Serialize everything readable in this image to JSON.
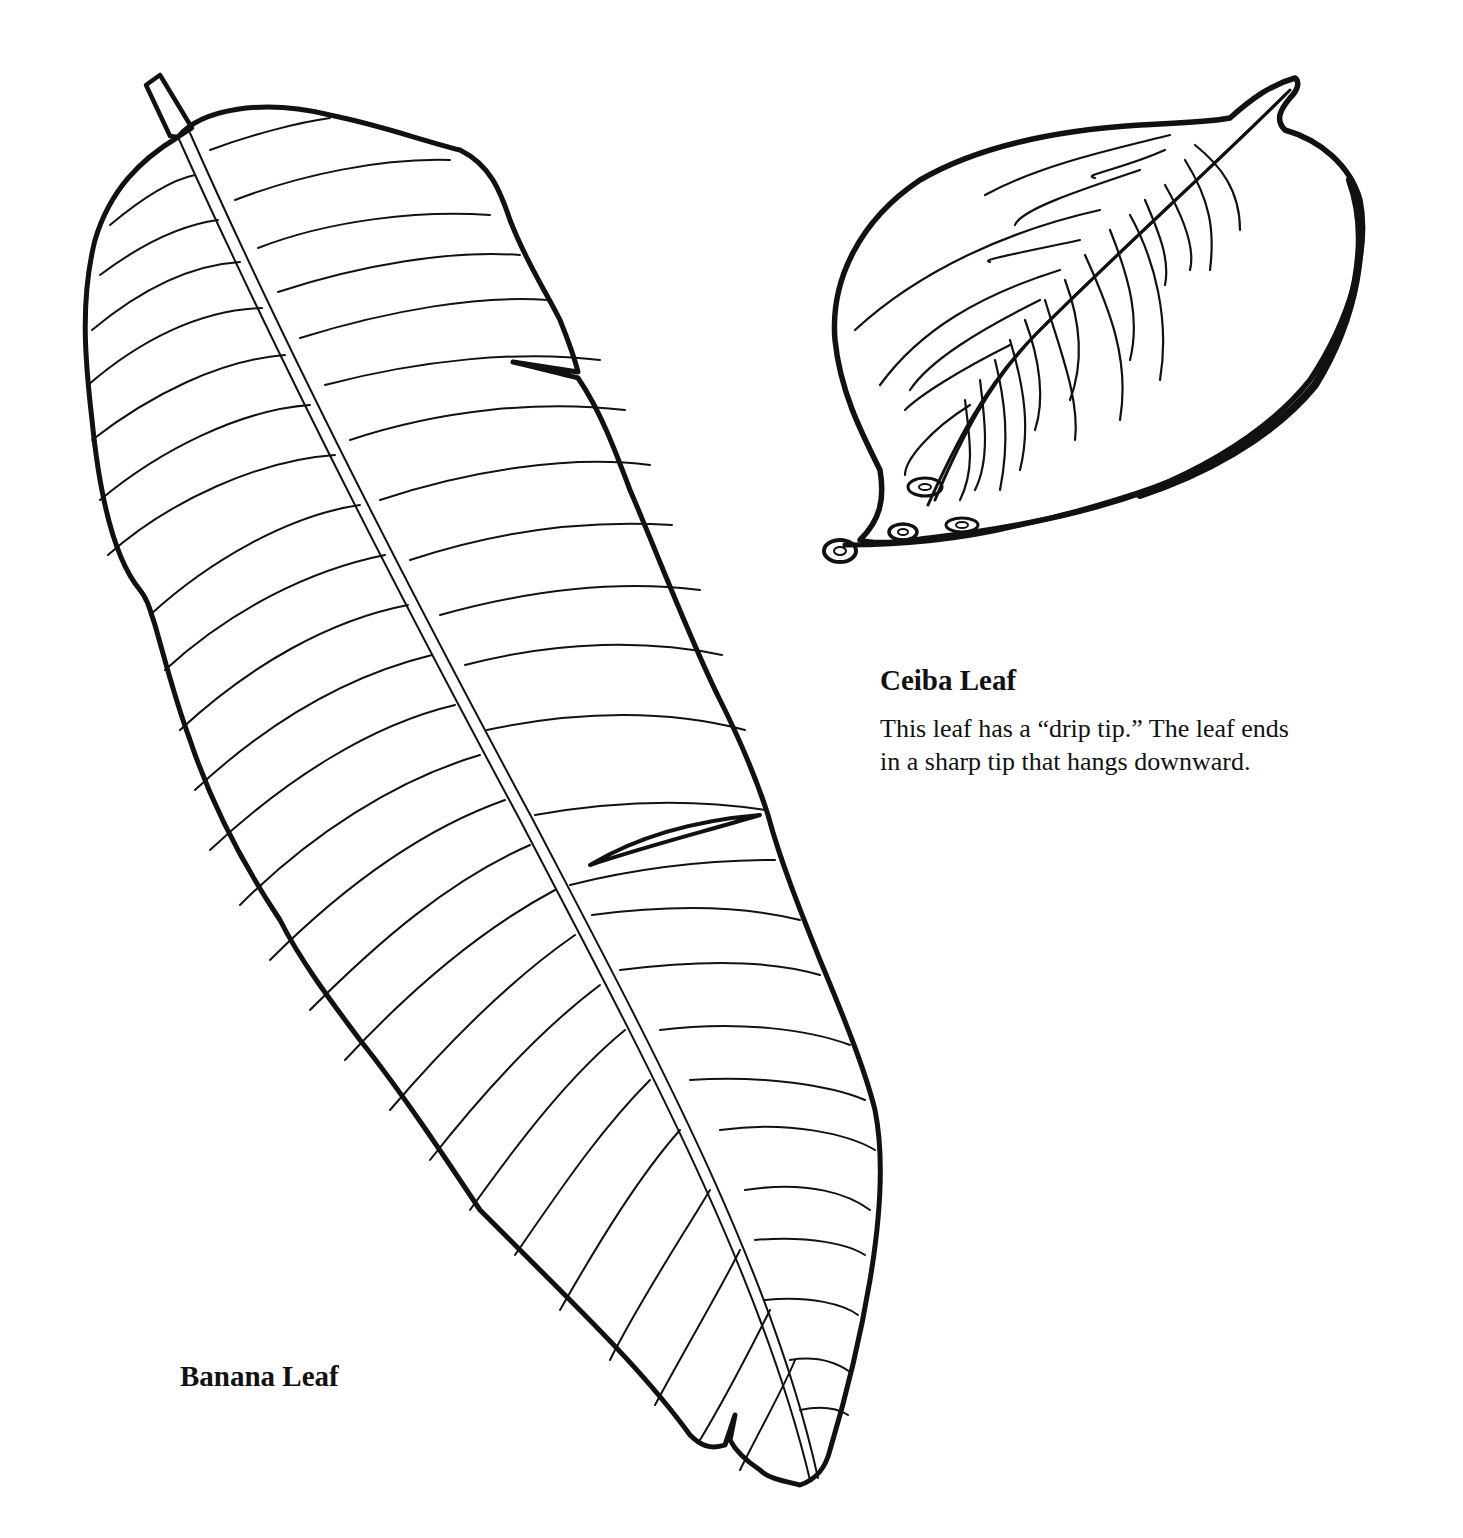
{
  "worksheet": {
    "banana_leaf": {
      "title": "Banana Leaf",
      "illustration": "banana-leaf-line-drawing"
    },
    "ceiba_leaf": {
      "title": "Ceiba Leaf",
      "description_lines": [
        "This leaf has a “drip tip.”  The leaf ends",
        "in a sharp tip that hangs downward."
      ],
      "illustration": "ceiba-leaf-line-drawing"
    },
    "colors": {
      "background": "#ffffff",
      "ink": "#111111"
    }
  }
}
